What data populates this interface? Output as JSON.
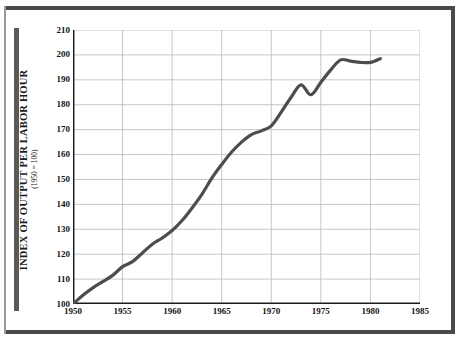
{
  "figure": {
    "frame_color": "#4a4a4a",
    "accent_bar_color": "#5a5a5a",
    "background": "#ffffff"
  },
  "chart_data": {
    "type": "line",
    "title": "",
    "xlabel": "",
    "ylabel": "INDEX OF OUTPUT PER LABOR HOUR",
    "ylabel_sub": "(1950 = 100)",
    "xlim": [
      1950,
      1985
    ],
    "ylim": [
      100,
      210
    ],
    "grid": true,
    "legend": "none",
    "line_color": "#4d4d4d",
    "line_width": 3.2,
    "x_ticks": [
      1950,
      1955,
      1960,
      1965,
      1970,
      1975,
      1980,
      1985
    ],
    "x_tick_labels": [
      "1950",
      "1955",
      "1960",
      "1965",
      "1970",
      "1975",
      "1980",
      "1985"
    ],
    "y_ticks": [
      100,
      110,
      120,
      130,
      140,
      150,
      160,
      170,
      180,
      190,
      200,
      210
    ],
    "y_tick_labels": [
      "100",
      "110",
      "120",
      "130",
      "140",
      "150",
      "160",
      "170",
      "180",
      "190",
      "200",
      "210"
    ],
    "series": [
      {
        "name": "Index of output per labor hour (1950 = 100)",
        "x": [
          1950,
          1951,
          1952,
          1953,
          1954,
          1955,
          1956,
          1957,
          1958,
          1959,
          1960,
          1961,
          1962,
          1963,
          1964,
          1965,
          1966,
          1967,
          1968,
          1969,
          1970,
          1971,
          1972,
          1973,
          1974,
          1975,
          1976,
          1977,
          1978,
          1979,
          1980,
          1981
        ],
        "values": [
          100.0,
          103.5,
          106.5,
          109.0,
          111.5,
          115.0,
          117.0,
          120.5,
          124.0,
          126.5,
          129.5,
          133.5,
          138.5,
          144.0,
          150.5,
          156.0,
          161.0,
          165.0,
          168.0,
          169.5,
          171.5,
          177.0,
          183.0,
          188.0,
          184.0,
          189.0,
          194.0,
          198.0,
          197.5,
          197.0,
          197.0,
          198.5
        ]
      }
    ]
  }
}
